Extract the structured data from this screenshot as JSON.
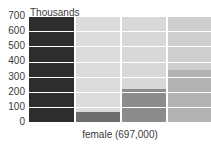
{
  "chart_data": {
    "type": "bar",
    "title": "",
    "subtitle": "",
    "unit_label": "Thousands",
    "xlabel": "female (697,000)",
    "ylabel": "",
    "ylim": [
      0,
      700
    ],
    "grid": true,
    "legend_position": "none",
    "categories": [
      "column-1",
      "column-2",
      "column-3",
      "column-4"
    ],
    "values": [
      700,
      75,
      225,
      350
    ],
    "yticks": [
      {
        "label": "700",
        "value": 700
      },
      {
        "label": "600",
        "value": 600
      },
      {
        "label": "500",
        "value": 500
      },
      {
        "label": "400",
        "value": 400
      },
      {
        "label": "300",
        "value": 300
      },
      {
        "label": "200",
        "value": 200
      },
      {
        "label": "100",
        "value": 100
      },
      {
        "label": "0",
        "value": 0
      }
    ],
    "series": [
      {
        "name": "female",
        "values": [
          700,
          75,
          225,
          350
        ]
      }
    ],
    "bar_colors": [
      "#2d2d2d",
      "#6e6e6e",
      "#8c8c8c",
      "#b3b3b3"
    ],
    "column_backgrounds": [
      "#d4d4d4",
      "#dcdcdc",
      "#d8d8d8",
      "#cfcfcf"
    ],
    "plot_background": "#d8d8d8",
    "gridline_color": "#ffffff",
    "total_label": "female (697,000)",
    "total_value": 697000
  },
  "axis": {
    "unit_caption": "Thousands",
    "x_caption": "female (697,000)"
  }
}
